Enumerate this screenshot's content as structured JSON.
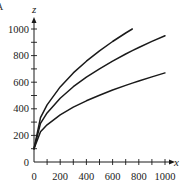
{
  "corner_mark": "A",
  "chart_data": {
    "type": "line",
    "title": "",
    "xlabel": "x",
    "ylabel": "z",
    "xlim": [
      0,
      1000
    ],
    "ylim": [
      0,
      1000
    ],
    "x_ticks": [
      0,
      200,
      400,
      600,
      800,
      1000
    ],
    "y_ticks": [
      0,
      200,
      400,
      600,
      800,
      1000
    ],
    "x_minor_step": 100,
    "y_minor_step": 100,
    "grid": false,
    "legend": null,
    "x": [
      0,
      50,
      100,
      200,
      300,
      400,
      500,
      600,
      700,
      750,
      800,
      900,
      1000
    ],
    "series": [
      {
        "name": "top curve",
        "values": [
          100,
          333,
          429,
          565,
          670,
          758,
          836,
          906,
          970,
          1000,
          null,
          null,
          null
        ]
      },
      {
        "name": "middle curve",
        "values": [
          100,
          290,
          369,
          480,
          566,
          638,
          701,
          759,
          812,
          837,
          861,
          907,
          950
        ]
      },
      {
        "name": "bottom curve",
        "values": [
          100,
          227,
          280,
          355,
          412,
          460,
          502,
          541,
          576,
          593,
          609,
          640,
          670
        ]
      }
    ],
    "colors": {
      "line": "#1a1a1a",
      "axis": "#1a1a1a",
      "background": "#ffffff"
    }
  }
}
